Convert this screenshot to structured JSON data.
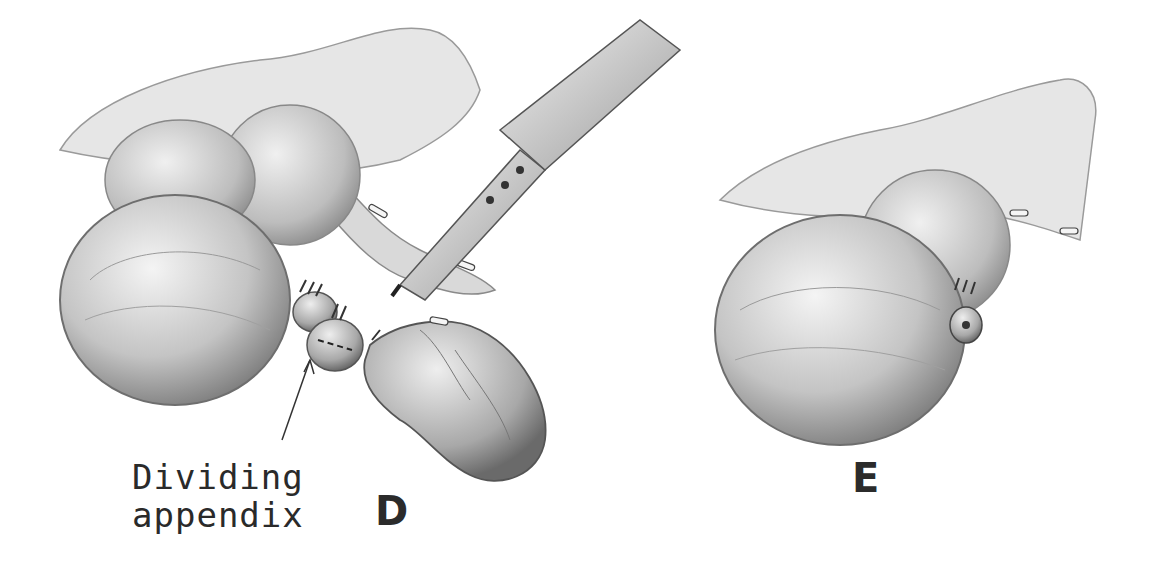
{
  "figure": {
    "type": "surgical-illustration",
    "panels": [
      {
        "id": "D",
        "letter": "D",
        "annotation": {
          "line1": "Dividing",
          "line2": "appendix"
        }
      },
      {
        "id": "E",
        "letter": "E"
      }
    ],
    "colors": {
      "background": "#ffffff",
      "ink": "#2b2b2b",
      "shade_dark": "#8a8a8a",
      "shade_light": "#d8d8d8"
    }
  }
}
